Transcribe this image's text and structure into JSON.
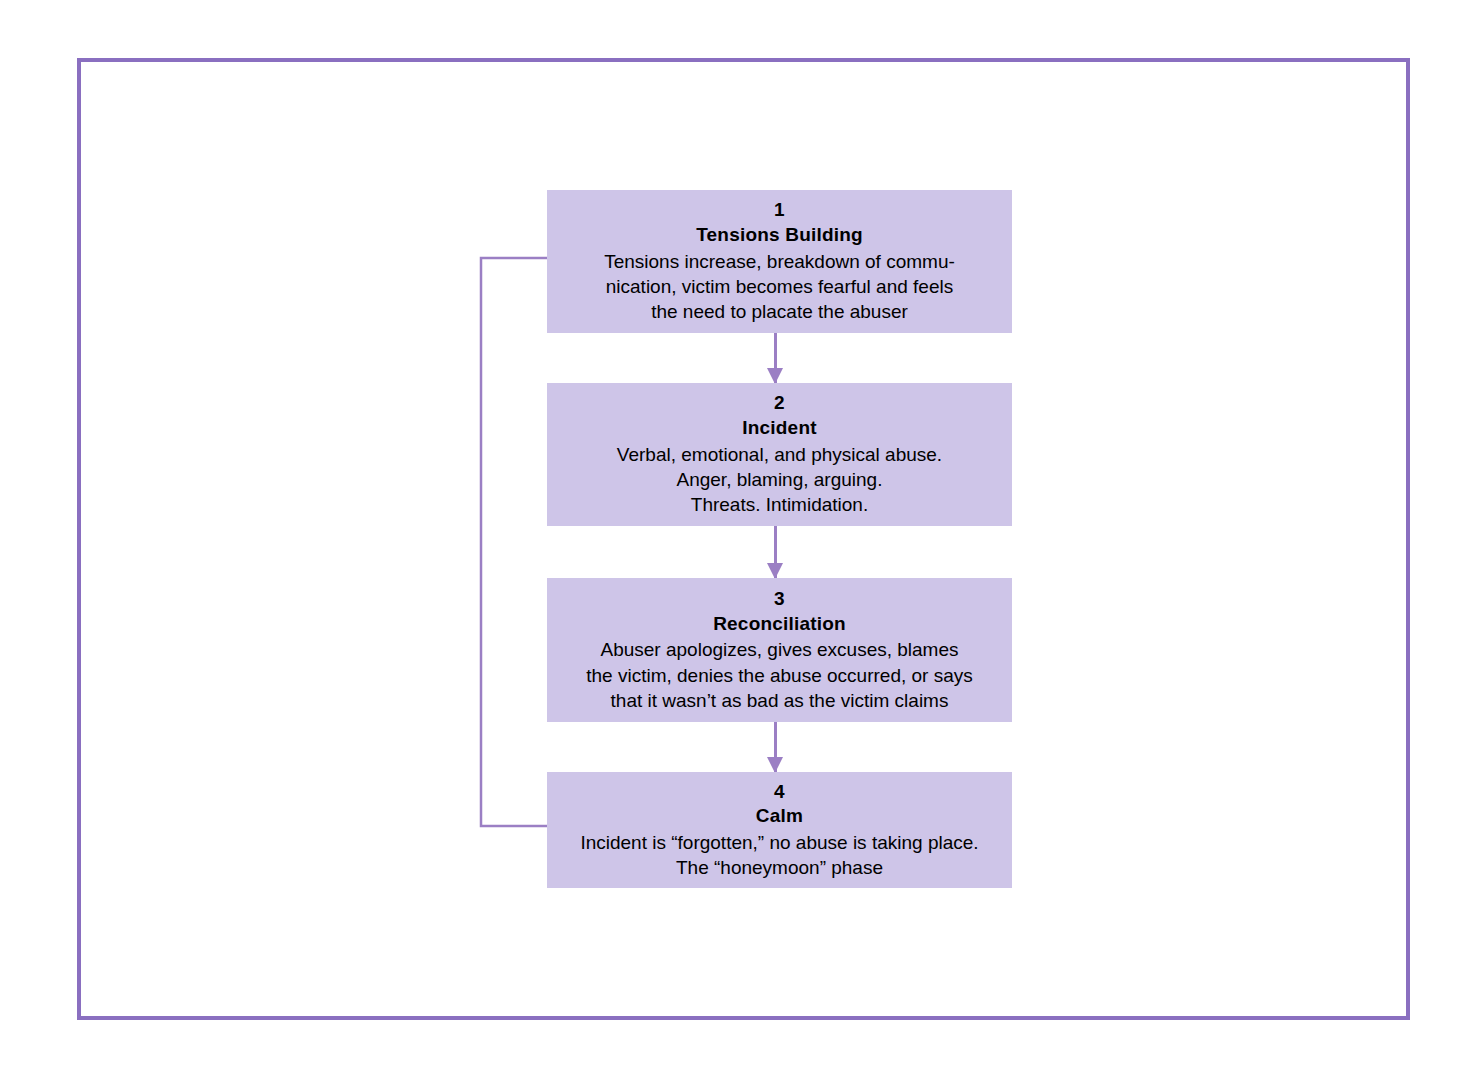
{
  "diagram": {
    "type": "flowchart",
    "colors": {
      "frame_border": "#8a6fc0",
      "box_fill": "#cec5e8",
      "arrow": "#9b7fc4",
      "text": "#000000",
      "background": "#ffffff"
    },
    "stages": [
      {
        "number": "1",
        "title": "Tensions Building",
        "description": "Tensions increase, breakdown of commu-\nnication, victim becomes fearful and feels\nthe need to placate the abuser"
      },
      {
        "number": "2",
        "title": "Incident",
        "description": "Verbal, emotional, and physical abuse.\nAnger, blaming, arguing.\nThreats. Intimidation."
      },
      {
        "number": "3",
        "title": "Reconciliation",
        "description": "Abuser apologizes, gives excuses, blames\nthe victim, denies the abuse occurred, or says\nthat it wasn’t as bad as the victim claims"
      },
      {
        "number": "4",
        "title": "Calm",
        "description": "Incident is “forgotten,” no abuse is taking place.\nThe “honeymoon” phase"
      }
    ],
    "connectors": [
      {
        "from": "1",
        "to": "2",
        "direction": "down"
      },
      {
        "from": "2",
        "to": "3",
        "direction": "down"
      },
      {
        "from": "3",
        "to": "4",
        "direction": "down"
      },
      {
        "from": "4",
        "to": "1",
        "direction": "loop-left-up"
      }
    ]
  }
}
